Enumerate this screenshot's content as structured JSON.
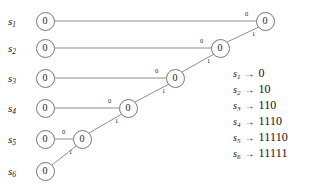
{
  "figure": {
    "type": "huffman-code-tree",
    "stroke_color": "#808080",
    "node_border_color": "#777777",
    "text_color": "#111111"
  },
  "sources": [
    {
      "id": "s1",
      "name": "s",
      "index": "1",
      "label_x": 8,
      "label_y": 21
    },
    {
      "id": "s2",
      "name": "s",
      "index": "2",
      "label_x": 8,
      "label_y": 48
    },
    {
      "id": "s3",
      "name": "s",
      "index": "3",
      "label_x": 8,
      "label_y": 78
    },
    {
      "id": "s4",
      "name": "s",
      "index": "4",
      "label_x": 8,
      "label_y": 108
    },
    {
      "id": "s5",
      "name": "s",
      "index": "5",
      "label_x": 8,
      "label_y": 139
    },
    {
      "id": "s6",
      "name": "s",
      "index": "6",
      "label_x": 8,
      "label_y": 171
    }
  ],
  "leaf_nodes": [
    {
      "id": "leaf-s1",
      "value": "0",
      "x": 45,
      "y": 21
    },
    {
      "id": "leaf-s2",
      "value": "0",
      "x": 45,
      "y": 48
    },
    {
      "id": "leaf-s3",
      "value": "0",
      "x": 45,
      "y": 78
    },
    {
      "id": "leaf-s4",
      "value": "0",
      "x": 45,
      "y": 108
    },
    {
      "id": "leaf-s5",
      "value": "0",
      "x": 45,
      "y": 139
    },
    {
      "id": "leaf-s6",
      "value": "0",
      "x": 45,
      "y": 171
    }
  ],
  "merge_nodes": [
    {
      "id": "merge-1",
      "value": "0",
      "x": 82,
      "y": 139
    },
    {
      "id": "merge-2",
      "value": "0",
      "x": 128,
      "y": 108
    },
    {
      "id": "merge-3",
      "value": "0",
      "x": 175,
      "y": 78
    },
    {
      "id": "merge-4",
      "value": "0",
      "x": 220,
      "y": 48
    },
    {
      "id": "merge-root",
      "value": "0",
      "x": 265,
      "y": 21
    }
  ],
  "edges": [
    {
      "id": "e-s5-m1",
      "x1": 55,
      "y1": 139,
      "x2": 73,
      "y2": 139,
      "bit": "0",
      "label_x": 62,
      "label_y": 129
    },
    {
      "id": "e-s6-m1",
      "x1": 52,
      "y1": 165,
      "x2": 76,
      "y2": 146,
      "bit": "1",
      "label_x": 69,
      "label_y": 149
    },
    {
      "id": "e-s4-m2",
      "x1": 55,
      "y1": 108,
      "x2": 119,
      "y2": 108,
      "bit": "0",
      "label_x": 108,
      "label_y": 98
    },
    {
      "id": "e-m1-m2",
      "x1": 89,
      "y1": 133,
      "x2": 122,
      "y2": 114,
      "bit": "1",
      "label_x": 115,
      "label_y": 118
    },
    {
      "id": "e-s3-m3",
      "x1": 55,
      "y1": 78,
      "x2": 166,
      "y2": 78,
      "bit": "0",
      "label_x": 155,
      "label_y": 68
    },
    {
      "id": "e-m2-m3",
      "x1": 135,
      "y1": 102,
      "x2": 169,
      "y2": 84,
      "bit": "1",
      "label_x": 162,
      "label_y": 88
    },
    {
      "id": "e-s2-m4",
      "x1": 55,
      "y1": 48,
      "x2": 211,
      "y2": 48,
      "bit": "0",
      "label_x": 200,
      "label_y": 38
    },
    {
      "id": "e-m3-m4",
      "x1": 182,
      "y1": 72,
      "x2": 214,
      "y2": 54,
      "bit": "1",
      "label_x": 207,
      "label_y": 58
    },
    {
      "id": "e-s1-root",
      "x1": 55,
      "y1": 21,
      "x2": 256,
      "y2": 21,
      "bit": "0",
      "label_x": 245,
      "label_y": 11
    },
    {
      "id": "e-m4-root",
      "x1": 227,
      "y1": 42,
      "x2": 259,
      "y2": 27,
      "bit": "1",
      "label_x": 252,
      "label_y": 31
    }
  ],
  "legend": {
    "arrow_glyph": "→",
    "rows": [
      {
        "symbol": "s",
        "index": "1",
        "code": "0"
      },
      {
        "symbol": "s",
        "index": "2",
        "code": "10"
      },
      {
        "symbol": "s",
        "index": "3",
        "code": "110"
      },
      {
        "symbol": "s",
        "index": "4",
        "code": "1110"
      },
      {
        "symbol": "s",
        "index": "5",
        "code": "11110"
      },
      {
        "symbol": "s",
        "index": "6",
        "code": "11111"
      }
    ]
  }
}
